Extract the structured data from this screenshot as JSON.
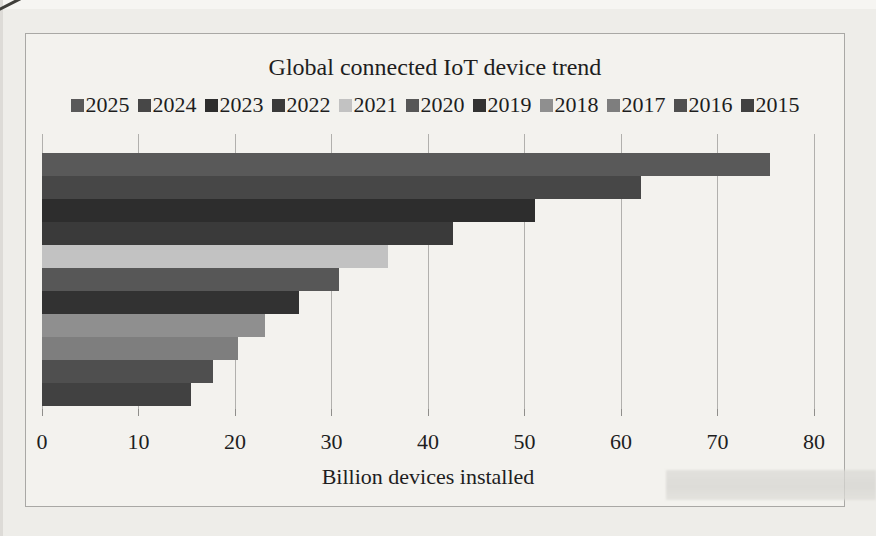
{
  "page": {
    "background_color": "#eeede9",
    "panel_background_color": "#f3f2ee",
    "panel_border_color": "#a9a8a5",
    "text_color": "#1e1e1e",
    "gridline_color": "#b1b0ad"
  },
  "chart": {
    "title": "Global connected IoT device trend",
    "xlabel": "Billion devices installed"
  },
  "chart_data": {
    "type": "bar",
    "orientation": "horizontal",
    "title": "Global connected IoT device trend",
    "xlabel": "Billion devices installed",
    "ylabel": "",
    "xlim": [
      0,
      80
    ],
    "x_ticks": [
      0,
      10,
      20,
      30,
      40,
      50,
      60,
      70,
      80
    ],
    "grid": true,
    "legend_position": "top",
    "categories": [
      "2025",
      "2024",
      "2023",
      "2022",
      "2021",
      "2020",
      "2019",
      "2018",
      "2017",
      "2016",
      "2015"
    ],
    "values": [
      75.44,
      62.12,
      51.11,
      42.62,
      35.82,
      30.73,
      26.66,
      23.14,
      20.35,
      17.68,
      15.41
    ],
    "colors": [
      "#595959",
      "#474747",
      "#2d2d2d",
      "#3a3a3a",
      "#c2c2c2",
      "#575757",
      "#323232",
      "#8f8f8f",
      "#7e7e7e",
      "#4f4f4f",
      "#414141"
    ]
  }
}
